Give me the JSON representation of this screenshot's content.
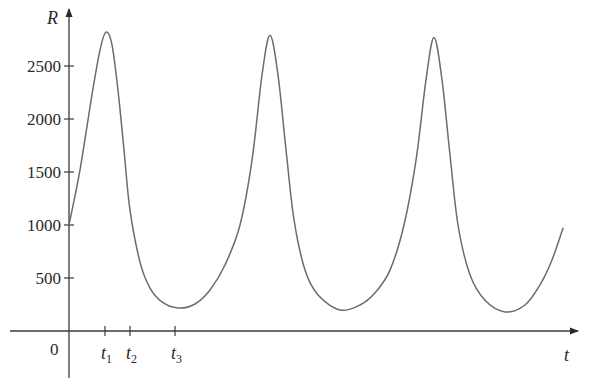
{
  "chart_data": {
    "type": "line",
    "title": "",
    "xlabel": "t",
    "ylabel": "R",
    "origin_label": "0",
    "grid": false,
    "legend": null,
    "ylim": [
      0,
      2900
    ],
    "y_ticks": [
      500,
      1000,
      1500,
      2000,
      2500
    ],
    "y_tick_labels": [
      "500",
      "1000",
      "1500",
      "2000",
      "2500"
    ],
    "x_ticks": [
      {
        "label": "t",
        "subscript": "1",
        "x": 36
      },
      {
        "label": "t",
        "subscript": "2",
        "x": 61
      },
      {
        "label": "t",
        "subscript": "3",
        "x": 106
      }
    ],
    "x_tick_note": "x values are relative horizontal positions (no numeric scale shown on t axis)",
    "series": [
      {
        "name": "R(t)",
        "color": "#6b6b6b",
        "x": [
          0,
          11,
          23,
          31,
          37,
          43,
          49,
          55,
          61,
          71,
          81,
          93,
          109,
          126,
          141,
          156,
          171,
          183,
          193,
          201,
          209,
          217,
          225,
          236,
          249,
          271,
          291,
          306,
          321,
          335,
          347,
          357,
          365,
          373,
          381,
          389,
          401,
          416,
          436,
          456,
          471,
          483,
          494
        ],
        "values": [
          1000,
          1520,
          2230,
          2650,
          2820,
          2700,
          2270,
          1710,
          1140,
          650,
          405,
          275,
          217,
          255,
          387,
          623,
          1000,
          1610,
          2415,
          2790,
          2415,
          1710,
          1050,
          575,
          340,
          198,
          245,
          360,
          575,
          1000,
          1610,
          2370,
          2770,
          2370,
          1660,
          1000,
          530,
          290,
          180,
          245,
          435,
          670,
          970
        ]
      }
    ],
    "annotations": {
      "peaks": [
        2820,
        2790,
        2770
      ],
      "troughs": [
        217,
        198,
        180
      ]
    }
  },
  "layout": {
    "origin_px": [
      69,
      331
    ],
    "px_per_unit_y": 0.106,
    "px_per_unit_x": 1,
    "x_axis_end_px": 577,
    "y_axis_top_px": 10,
    "axis_color": "#3a3a3a",
    "curve_color": "#6b6b6b"
  }
}
